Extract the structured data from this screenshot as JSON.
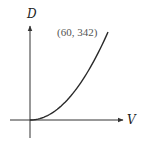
{
  "chart_data": {
    "type": "line",
    "title": "",
    "xlabel": "V",
    "ylabel": "D",
    "series": [
      {
        "name": "D(V)",
        "x": [
          0,
          10,
          20,
          30,
          40,
          50,
          60
        ],
        "values": [
          0,
          9.5,
          38,
          85.5,
          152,
          237.5,
          342
        ]
      }
    ],
    "annotations": [
      {
        "text": "(60, 342)",
        "x": 60,
        "y": 342
      }
    ],
    "xlim": [
      0,
      60
    ],
    "ylim": [
      0,
      342
    ],
    "grid": false,
    "legend": null
  },
  "labels": {
    "x_axis": "V",
    "y_axis": "D",
    "point": "(60, 342)"
  },
  "colors": {
    "curve": "#2a2a2a",
    "axes": "#333333",
    "label": "#555555"
  }
}
